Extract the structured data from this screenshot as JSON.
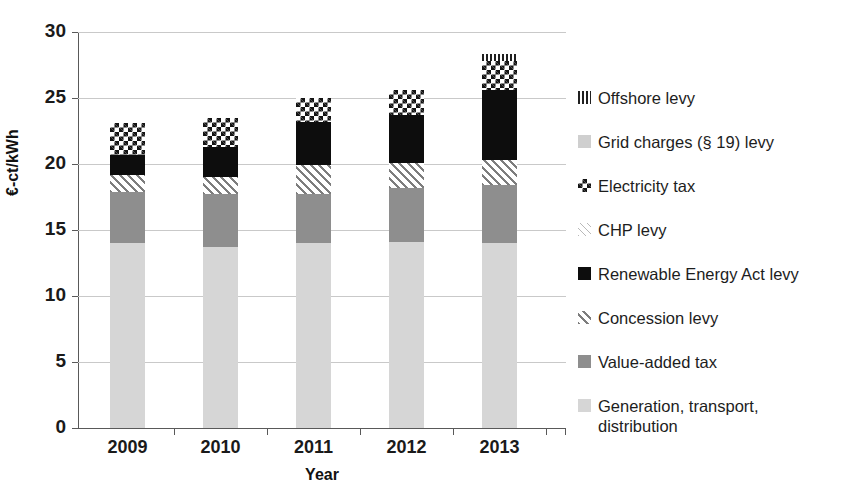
{
  "chart_data": {
    "type": "bar",
    "subtype": "stacked-bar",
    "title": "",
    "xlabel": "Year",
    "ylabel": "€-ct/kWh",
    "categories": [
      "2009",
      "2010",
      "2011",
      "2012",
      "2013"
    ],
    "ylim": [
      0,
      30
    ],
    "yticks": [
      0,
      5,
      10,
      15,
      20,
      25,
      30
    ],
    "ytick_labels": [
      "0",
      "5",
      "10",
      "15",
      "20",
      "25",
      "30"
    ],
    "grid": true,
    "grid_axis": "y",
    "legend_position": "right",
    "stack_order_bottom_to_top": [
      "Generation, transport, distribution",
      "Value-added tax",
      "Concession levy",
      "Renewable Energy Act levy",
      "CHP levy",
      "Electricity tax",
      "Grid charges (§ 19) levy",
      "Offshore levy"
    ],
    "series": [
      {
        "name": "Generation, transport, distribution",
        "values": [
          14.0,
          13.7,
          14.0,
          14.1,
          14.0
        ]
      },
      {
        "name": "Value-added tax",
        "values": [
          3.9,
          4.0,
          3.7,
          4.1,
          4.4
        ]
      },
      {
        "name": "Concession levy",
        "values": [
          1.3,
          1.3,
          2.2,
          1.9,
          1.9
        ]
      },
      {
        "name": "Renewable Energy Act levy",
        "values": [
          1.5,
          2.3,
          3.3,
          3.6,
          5.3
        ]
      },
      {
        "name": "CHP levy",
        "values": [
          2.4,
          2.2,
          1.8,
          1.9,
          2.2
        ]
      },
      {
        "name": "Electricity tax",
        "values": [
          0.0,
          0.0,
          0.0,
          0.0,
          0.0
        ]
      },
      {
        "name": "Grid charges (§ 19) levy",
        "values": [
          0.0,
          0.0,
          0.0,
          0.0,
          0.0
        ]
      },
      {
        "name": "Offshore levy",
        "values": [
          0.0,
          0.0,
          0.0,
          0.0,
          0.5
        ]
      }
    ],
    "totals": [
      23.1,
      23.5,
      25.0,
      25.6,
      28.3
    ],
    "bars": [
      {
        "category": "2009",
        "total": 23.1,
        "segments": [
          {
            "key": "generation",
            "label": "Generation, transport, distribution",
            "from": 0.0,
            "to": 14.0
          },
          {
            "key": "vat",
            "label": "Value-added tax",
            "from": 14.0,
            "to": 17.9
          },
          {
            "key": "concession",
            "label": "Concession levy",
            "from": 17.9,
            "to": 19.2
          },
          {
            "key": "eeg",
            "label": "Renewable Energy Act levy",
            "from": 19.2,
            "to": 20.7
          },
          {
            "key": "electricity",
            "label": "Electricity tax",
            "from": 20.7,
            "to": 23.1
          }
        ]
      },
      {
        "category": "2010",
        "total": 23.5,
        "segments": [
          {
            "key": "generation",
            "label": "Generation, transport, distribution",
            "from": 0.0,
            "to": 13.7
          },
          {
            "key": "vat",
            "label": "Value-added tax",
            "from": 13.7,
            "to": 17.7
          },
          {
            "key": "concession",
            "label": "Concession levy",
            "from": 17.7,
            "to": 19.0
          },
          {
            "key": "eeg",
            "label": "Renewable Energy Act levy",
            "from": 19.0,
            "to": 21.3
          },
          {
            "key": "electricity",
            "label": "Electricity tax",
            "from": 21.3,
            "to": 23.5
          }
        ]
      },
      {
        "category": "2011",
        "total": 25.0,
        "segments": [
          {
            "key": "generation",
            "label": "Generation, transport, distribution",
            "from": 0.0,
            "to": 14.0
          },
          {
            "key": "vat",
            "label": "Value-added tax",
            "from": 14.0,
            "to": 17.7
          },
          {
            "key": "concession",
            "label": "Concession levy",
            "from": 17.7,
            "to": 19.9
          },
          {
            "key": "eeg",
            "label": "Renewable Energy Act levy",
            "from": 19.9,
            "to": 23.2
          },
          {
            "key": "electricity",
            "label": "Electricity tax",
            "from": 23.2,
            "to": 25.0
          }
        ]
      },
      {
        "category": "2012",
        "total": 25.6,
        "segments": [
          {
            "key": "generation",
            "label": "Generation, transport, distribution",
            "from": 0.0,
            "to": 14.1
          },
          {
            "key": "vat",
            "label": "Value-added tax",
            "from": 14.1,
            "to": 18.2
          },
          {
            "key": "concession",
            "label": "Concession levy",
            "from": 18.2,
            "to": 20.1
          },
          {
            "key": "eeg",
            "label": "Renewable Energy Act levy",
            "from": 20.1,
            "to": 23.7
          },
          {
            "key": "electricity",
            "label": "Electricity tax",
            "from": 23.7,
            "to": 25.6
          }
        ]
      },
      {
        "category": "2013",
        "total": 28.3,
        "segments": [
          {
            "key": "generation",
            "label": "Generation, transport, distribution",
            "from": 0.0,
            "to": 14.0
          },
          {
            "key": "vat",
            "label": "Value-added tax",
            "from": 14.0,
            "to": 18.4
          },
          {
            "key": "concession",
            "label": "Concession levy",
            "from": 18.4,
            "to": 20.3
          },
          {
            "key": "eeg",
            "label": "Renewable Energy Act levy",
            "from": 20.3,
            "to": 25.6
          },
          {
            "key": "electricity",
            "label": "Electricity tax",
            "from": 25.6,
            "to": 27.8
          },
          {
            "key": "offshore",
            "label": "Offshore levy",
            "from": 27.8,
            "to": 28.3
          }
        ]
      }
    ],
    "legend": [
      {
        "key": "offshore",
        "label": "Offshore levy"
      },
      {
        "key": "grid19",
        "label": "Grid charges (§ 19) levy"
      },
      {
        "key": "electricity",
        "label": "Electricity tax"
      },
      {
        "key": "chp",
        "label": "CHP levy"
      },
      {
        "key": "eeg",
        "label": "Renewable Energy Act levy"
      },
      {
        "key": "concession",
        "label": "Concession levy"
      },
      {
        "key": "vat",
        "label": "Value-added tax"
      },
      {
        "key": "generation",
        "label": "Generation, transport,\ndistribution"
      }
    ],
    "colors": {
      "generation": "#d6d6d6",
      "vat": "#8e8e8e",
      "concession": "#7d7d7d",
      "eeg": "#0d0d0d",
      "chp": "#b9b9b9",
      "electricity": "#141414",
      "grid19": "#cfcfcf",
      "offshore": "#202020",
      "gridline": "#c9c9c9",
      "axis": "#595959",
      "text": "#1a1a1a",
      "background": "#ffffff"
    }
  }
}
